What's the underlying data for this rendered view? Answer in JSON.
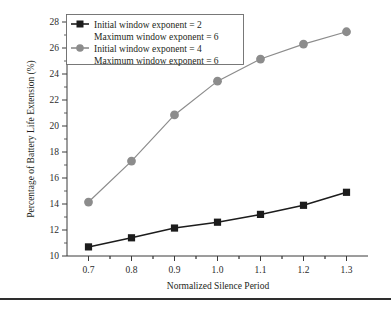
{
  "chart_data": {
    "type": "line",
    "title": "",
    "subtitle": "",
    "xlabel": "Normalized Silence Period",
    "ylabel": "Percentage of Battery Life Extension (%)",
    "x": [
      0.7,
      0.8,
      0.9,
      1.0,
      1.1,
      1.2,
      1.3
    ],
    "categories": [
      "0.7",
      "0.8",
      "0.9",
      "1.0",
      "1.1",
      "1.2",
      "1.3"
    ],
    "xlim": [
      0.65,
      1.35
    ],
    "ylim": [
      10,
      28
    ],
    "xticks": [
      "0.7",
      "0.8",
      "0.9",
      "1.0",
      "1.1",
      "1.2",
      "1.3"
    ],
    "yticks": [
      "10",
      "12",
      "14",
      "16",
      "18",
      "20",
      "22",
      "24",
      "26",
      "28"
    ],
    "grid": false,
    "legend_position": "top-left",
    "series": [
      {
        "name": "Initial window exponent = 2\nMaximum window exponent = 6",
        "legend_line1": "Initial window exponent = 2",
        "legend_line2": "Maximum window exponent = 6",
        "marker": "square",
        "color": "#1c1c1c",
        "values": [
          10.7,
          11.4,
          12.15,
          12.6,
          13.2,
          13.9,
          14.9
        ]
      },
      {
        "name": "Initial window exponent = 4\nMaximum window exponent = 6",
        "legend_line1": "Initial window exponent = 4",
        "legend_line2": "Maximum window exponent = 6",
        "marker": "circle",
        "color": "#8c8c8c",
        "values": [
          14.15,
          17.3,
          20.85,
          23.45,
          25.15,
          26.3,
          27.25
        ]
      }
    ]
  },
  "axes": {
    "y_title": "Percentage of Battery Life Extension (%)",
    "x_title": "Normalized Silence Period"
  },
  "colors": {
    "series1": "#1c1c1c",
    "series2": "#8c8c8c",
    "axis": "#3a3a3a",
    "legend_border": "#6b6b6b",
    "rule": "#2e2e2e"
  }
}
